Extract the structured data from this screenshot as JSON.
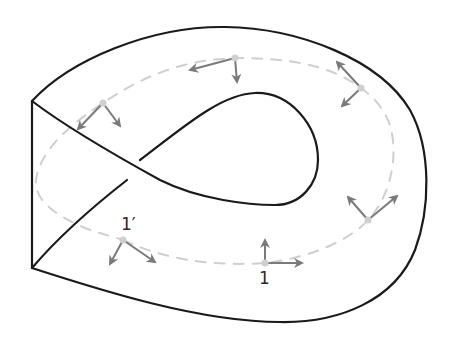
{
  "diagram": {
    "type": "non-orientable-surface-frame-transport",
    "labels": {
      "start_point": "1",
      "end_point": "1′"
    },
    "colors": {
      "surface_edge": "#1a1a1a",
      "path_dash": "#cfcfcf",
      "frame_vector": "#7a7a7a",
      "base_point": "#cfcfcf"
    },
    "frames": [
      {
        "id": "frame-1",
        "label": "1",
        "base": [
          265,
          263
        ],
        "vectors": [
          [
            265,
            240
          ],
          [
            302,
            263
          ]
        ]
      },
      {
        "id": "frame-2",
        "label": "",
        "base": [
          368,
          220
        ],
        "vectors": [
          [
            348,
            197
          ],
          [
            397,
            196
          ]
        ]
      },
      {
        "id": "frame-3",
        "label": "",
        "base": [
          361,
          88
        ],
        "vectors": [
          [
            337,
            62
          ],
          [
            342,
            106
          ]
        ]
      },
      {
        "id": "frame-4",
        "label": "",
        "base": [
          235,
          58
        ],
        "vectors": [
          [
            190,
            70
          ],
          [
            237,
            82
          ]
        ]
      },
      {
        "id": "frame-5",
        "label": "",
        "base": [
          103,
          103
        ],
        "vectors": [
          [
            78,
            129
          ],
          [
            120,
            126
          ]
        ]
      },
      {
        "id": "frame-6",
        "label": "1′",
        "base": [
          123,
          240
        ],
        "vectors": [
          [
            110,
            264
          ],
          [
            155,
            262
          ]
        ]
      }
    ]
  }
}
